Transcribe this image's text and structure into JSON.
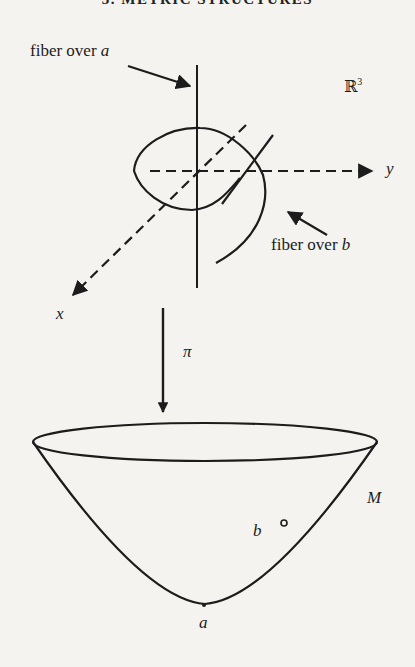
{
  "header": {
    "title": "3. METRIC STRUCTURES"
  },
  "figure": {
    "labels": {
      "fiber_a": "fiber over ",
      "fiber_a_var": "a",
      "fiber_b": "fiber over ",
      "fiber_b_var": "b",
      "space": "ℝ",
      "space_exp": "3",
      "axis_x": "x",
      "axis_y": "y",
      "projection": "π",
      "manifold": "M",
      "point_a": "a",
      "point_b": "b"
    },
    "colors": {
      "ink": "#1c1c1c",
      "paper": "#f4f3f0"
    }
  }
}
